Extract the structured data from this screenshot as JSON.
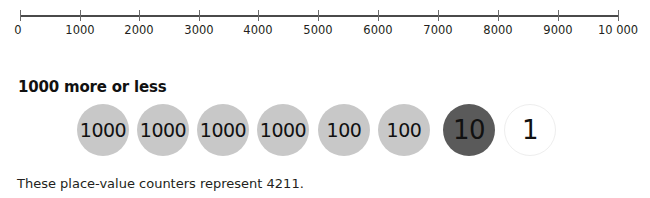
{
  "number_line": {
    "min": 0,
    "max": 10000,
    "ticks": [
      {
        "value": 0,
        "label": "0",
        "x": 20
      },
      {
        "value": 1000,
        "label": "1000",
        "x": 80
      },
      {
        "value": 2000,
        "label": "2000",
        "x": 139
      },
      {
        "value": 3000,
        "label": "3000",
        "x": 199
      },
      {
        "value": 4000,
        "label": "4000",
        "x": 258
      },
      {
        "value": 5000,
        "label": "5000",
        "x": 318
      },
      {
        "value": 6000,
        "label": "6000",
        "x": 378
      },
      {
        "value": 7000,
        "label": "7000",
        "x": 438
      },
      {
        "value": 8000,
        "label": "8000",
        "x": 498
      },
      {
        "value": 9000,
        "label": "9000",
        "x": 558
      },
      {
        "value": 10000,
        "label": "10 000",
        "x": 618
      }
    ]
  },
  "section": {
    "heading": "1000 more or less"
  },
  "counters": [
    {
      "label": "1000",
      "value": 1000,
      "style": "light",
      "x": 77
    },
    {
      "label": "1000",
      "value": 1000,
      "style": "light",
      "x": 137
    },
    {
      "label": "1000",
      "value": 1000,
      "style": "light",
      "x": 197
    },
    {
      "label": "1000",
      "value": 1000,
      "style": "light",
      "x": 257
    },
    {
      "label": "100",
      "value": 100,
      "style": "light",
      "x": 318
    },
    {
      "label": "100",
      "value": 100,
      "style": "light",
      "x": 378
    },
    {
      "label": "10",
      "value": 10,
      "style": "dark",
      "x": 443
    },
    {
      "label": "1",
      "value": 1,
      "style": "white",
      "x": 504
    }
  ],
  "colors": {
    "counter_light": "#c8c8c8",
    "counter_dark": "#5a5a5a",
    "counter_white": "#ffffff"
  },
  "caption": "These place-value counters represent 4211."
}
